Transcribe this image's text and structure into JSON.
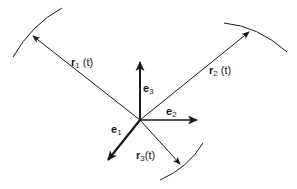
{
  "diagram": {
    "colors": {
      "stroke": "#1a1a1a",
      "background": "#ffffff"
    },
    "origin": {
      "x": 140,
      "y": 120
    },
    "basis_vectors": [
      {
        "id": "e1",
        "base": "e",
        "sub": "1",
        "end": {
          "x": 108,
          "y": 160
        }
      },
      {
        "id": "e2",
        "base": "e",
        "sub": "2",
        "end": {
          "x": 197,
          "y": 120
        }
      },
      {
        "id": "e3",
        "base": "e",
        "sub": "3",
        "end": {
          "x": 140,
          "y": 62
        }
      }
    ],
    "position_vectors": [
      {
        "id": "r1",
        "base": "r",
        "sub": "1",
        "arg": "(t)",
        "end": {
          "x": 33,
          "y": 36
        }
      },
      {
        "id": "r2",
        "base": "r",
        "sub": "2",
        "arg": "(t)",
        "end": {
          "x": 249,
          "y": 32
        }
      },
      {
        "id": "r3",
        "base": "r",
        "sub": "3",
        "arg": "(t)",
        "end": {
          "x": 180,
          "y": 164
        }
      }
    ],
    "labels": {
      "r1": {
        "base": "r",
        "sub": "1",
        "arg": "(t)"
      },
      "r2": {
        "base": "r",
        "sub": "2",
        "arg": "(t)"
      },
      "r3": {
        "base": "r",
        "sub": "3",
        "arg": "(t)"
      },
      "e1": {
        "base": "e",
        "sub": "1"
      },
      "e2": {
        "base": "e",
        "sub": "2"
      },
      "e3": {
        "base": "e",
        "sub": "3"
      }
    }
  }
}
